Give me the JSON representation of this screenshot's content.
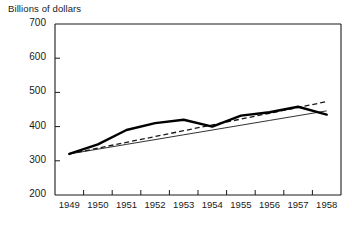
{
  "chart_data": {
    "type": "line",
    "title": "",
    "ylabel": "Billions of dollars",
    "xlabel": "",
    "ylim": [
      200,
      700
    ],
    "yticks": [
      200,
      300,
      400,
      500,
      600,
      700
    ],
    "ytick_labels": [
      "200",
      "300",
      "400",
      "500",
      "600",
      "700"
    ],
    "categories": [
      "1949",
      "1950",
      "1951",
      "1952",
      "1953",
      "1954",
      "1955",
      "1956",
      "1957",
      "1958"
    ],
    "x": [
      1949,
      1950,
      1951,
      1952,
      1953,
      1954,
      1955,
      1956,
      1957,
      1958
    ],
    "grid": false,
    "legend": "none",
    "series": [
      {
        "name": "actual",
        "style": "solid-thick",
        "values": [
          320,
          348,
          390,
          410,
          420,
          400,
          432,
          442,
          458,
          435
        ]
      },
      {
        "name": "trend-dashed",
        "style": "dashed",
        "values": [
          320,
          337,
          354,
          371,
          388,
          405,
          422,
          439,
          456,
          473
        ]
      },
      {
        "name": "trend-thin",
        "style": "solid-thin",
        "values": [
          320,
          334,
          348,
          362,
          376,
          390,
          404,
          418,
          432,
          446
        ]
      }
    ]
  },
  "labels": {
    "y_axis_caption": "Billions of dollars"
  }
}
